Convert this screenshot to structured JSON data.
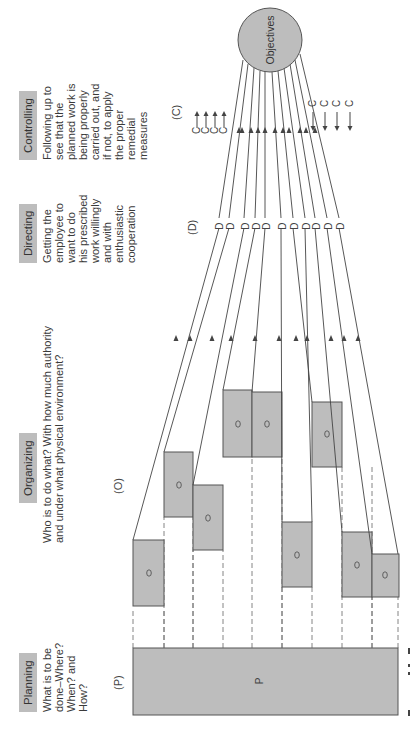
{
  "functions": [
    {
      "id": "planning",
      "header": "Planning",
      "symbol": "(P)",
      "description": [
        "What is to be",
        "done–Where?",
        "When? and",
        "How?"
      ]
    },
    {
      "id": "organizing",
      "header": "Organizing",
      "symbol": "(O)",
      "description": [
        "Who is to do what? With how much authority",
        "and under what physical environment?"
      ]
    },
    {
      "id": "directing",
      "header": "Directing",
      "symbol": "(D)",
      "description": [
        "Getting the",
        "employee to",
        "want to do",
        "his prescribed",
        "work willingly",
        "and with",
        "enthusiastic",
        "cooperation"
      ]
    },
    {
      "id": "controlling",
      "header": "Controlling",
      "symbol": "(C)",
      "description": [
        "Following up to",
        "see that the",
        "planned work is",
        "being properly",
        "carried out, and",
        "if not, to apply",
        "the proper",
        "remedial",
        "measures"
      ]
    }
  ],
  "diagram": {
    "plan_box_label": "P",
    "org_box_label": "O",
    "direct_label": "D",
    "control_label": "C",
    "objectives_label": "Objectives",
    "org_box_count": 9,
    "direct_line_count": 11,
    "control_arrows_left": 4,
    "control_arrows_right": 4
  },
  "caption_fragment": "Fi",
  "colors": {
    "box_fill": "#bdbdbd",
    "stroke": "#555555",
    "header_fill": "#bdbdbd",
    "text": "#3a3a3a"
  }
}
